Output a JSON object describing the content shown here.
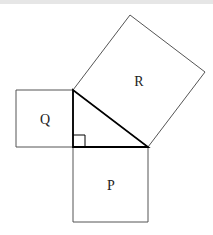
{
  "diagram": {
    "title": "",
    "triangle": {
      "right_angle_vertex": [
        73,
        147
      ],
      "top_vertex": [
        73,
        90
      ],
      "right_vertex": [
        148,
        147
      ],
      "stroke": "#000000",
      "right_angle_marker": true
    },
    "squares": [
      {
        "label": "P",
        "side": "bottom leg",
        "points": [
          [
            73,
            147
          ],
          [
            148,
            147
          ],
          [
            148,
            222
          ],
          [
            73,
            222
          ]
        ],
        "label_pos": [
          111,
          190
        ]
      },
      {
        "label": "Q",
        "side": "left leg",
        "points": [
          [
            16,
            90
          ],
          [
            73,
            90
          ],
          [
            73,
            147
          ],
          [
            16,
            147
          ]
        ],
        "label_pos": [
          45,
          124
        ]
      },
      {
        "label": "R",
        "side": "hypotenuse",
        "points": [
          [
            73,
            90
          ],
          [
            130,
            15
          ],
          [
            205,
            72
          ],
          [
            148,
            147
          ]
        ],
        "label_pos": [
          139,
          86
        ]
      }
    ],
    "colors": {
      "square_stroke": "#555555",
      "triangle_stroke": "#000000",
      "background": "#ffffff"
    }
  },
  "labels": {
    "p": "P",
    "q": "Q",
    "r": "R"
  }
}
